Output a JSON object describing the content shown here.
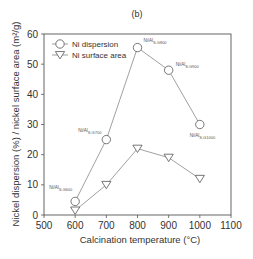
{
  "chart_data": {
    "type": "line",
    "title": "(b)",
    "xlabel": "Calcination temperature (°C)",
    "ylabel": "Nickel dispersion (%) / nickel surface area (m²/g)",
    "xlim": [
      500,
      1100
    ],
    "ylim": [
      0,
      60
    ],
    "xticks": [
      500,
      600,
      700,
      800,
      900,
      1000,
      1100
    ],
    "yticks": [
      0,
      10,
      20,
      30,
      40,
      50,
      60
    ],
    "grid": false,
    "legend_position": "upper left",
    "x": [
      600,
      700,
      800,
      900,
      1000
    ],
    "series": [
      {
        "name": "Ni dispersion",
        "marker": "circle",
        "values": [
          4.5,
          25,
          55.5,
          48,
          30
        ]
      },
      {
        "name": "Ni surface area",
        "marker": "triangle-down",
        "values": [
          1.5,
          10,
          22,
          19,
          12
        ]
      }
    ],
    "annotations": [
      {
        "x": 600,
        "base": "Ni/Al",
        "sub": "S.G600"
      },
      {
        "x": 700,
        "base": "Ni/Al",
        "sub": "S.G700"
      },
      {
        "x": 800,
        "base": "Ni/Al",
        "sub": "S.G800"
      },
      {
        "x": 900,
        "base": "Ni/Al",
        "sub": "S.G900"
      },
      {
        "x": 1000,
        "base": "Ni/Al",
        "sub": "S.G1000"
      }
    ]
  },
  "colors": {
    "axis": "#555555",
    "line": "#777777",
    "marker_fill": "#ffffff",
    "text": "#333333"
  }
}
